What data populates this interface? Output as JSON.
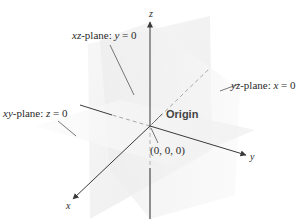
{
  "diagram": {
    "type": "3d-coordinate-planes",
    "colors": {
      "axis": "#3a3a3a",
      "dashed_axis": "#a8a8a8",
      "plane_fill": "#eeeeee",
      "leader_line": "#555555",
      "background": "#ffffff"
    },
    "axes": {
      "x": {
        "label": "x"
      },
      "y": {
        "label": "y"
      },
      "z": {
        "label": "z"
      }
    },
    "planes": [
      {
        "id": "xz",
        "name_italic": "xz",
        "suffix": "-plane: ",
        "eq_var": "y",
        "eq_rest": " = 0"
      },
      {
        "id": "yz",
        "name_italic": "yz",
        "suffix": "-plane: ",
        "eq_var": "x",
        "eq_rest": " = 0"
      },
      {
        "id": "xy",
        "name_italic": "xy",
        "suffix": "-plane: ",
        "eq_var": "z",
        "eq_rest": " = 0"
      }
    ],
    "origin": {
      "label": "Origin",
      "coords": "(0, 0, 0)"
    }
  }
}
